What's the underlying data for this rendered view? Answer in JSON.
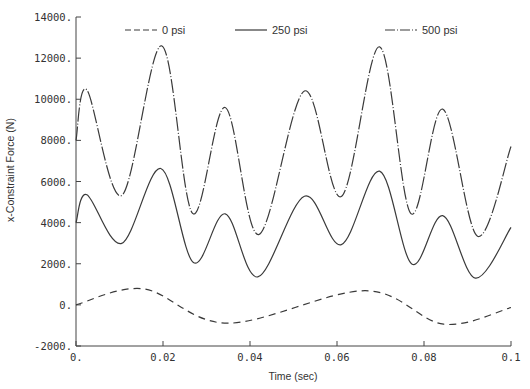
{
  "chart_data": {
    "type": "line",
    "title": "",
    "xlabel": "Time (sec)",
    "ylabel": "x-Constraint Force (N)",
    "xlim": [
      0,
      0.1
    ],
    "ylim": [
      -2000,
      14000
    ],
    "x_ticks": [
      0,
      0.02,
      0.04,
      0.06,
      0.08,
      0.1
    ],
    "x_tick_labels": [
      "0.",
      "0.02",
      "0.04",
      "0.06",
      "0.08",
      "0.1"
    ],
    "y_ticks": [
      -2000,
      0,
      2000,
      4000,
      6000,
      8000,
      10000,
      12000,
      14000
    ],
    "y_tick_labels": [
      "-2000.",
      "0.",
      "2000.",
      "4000.",
      "6000.",
      "8000.",
      "10000.",
      "12000.",
      "14000."
    ],
    "grid": false,
    "legend_position": "top",
    "series": [
      {
        "name": "0 psi",
        "style": "dashed",
        "points": [
          [
            0,
            0
          ],
          [
            0.0155,
            780
          ],
          [
            0.0348,
            -890
          ],
          [
            0.0665,
            690
          ],
          [
            0.0845,
            -940
          ],
          [
            0.1,
            -130
          ]
        ]
      },
      {
        "name": "250 psi",
        "style": "solid",
        "points": [
          [
            0,
            4000
          ],
          [
            0.0025,
            5360
          ],
          [
            0.0105,
            2990
          ],
          [
            0.0195,
            6630
          ],
          [
            0.027,
            2060
          ],
          [
            0.0343,
            4430
          ],
          [
            0.0418,
            1360
          ],
          [
            0.0525,
            5280
          ],
          [
            0.061,
            2930
          ],
          [
            0.0698,
            6500
          ],
          [
            0.0772,
            1990
          ],
          [
            0.0843,
            4340
          ],
          [
            0.0918,
            1300
          ],
          [
            0.1,
            3770
          ]
        ]
      },
      {
        "name": "500 psi",
        "style": "dash-dot",
        "points": [
          [
            0,
            8000
          ],
          [
            0.0025,
            10450
          ],
          [
            0.0105,
            5320
          ],
          [
            0.0197,
            12600
          ],
          [
            0.0268,
            4450
          ],
          [
            0.0343,
            9600
          ],
          [
            0.042,
            3420
          ],
          [
            0.0525,
            10400
          ],
          [
            0.061,
            5270
          ],
          [
            0.0698,
            12550
          ],
          [
            0.077,
            4440
          ],
          [
            0.0843,
            9520
          ],
          [
            0.0923,
            3340
          ],
          [
            0.1,
            7700
          ]
        ]
      }
    ]
  }
}
